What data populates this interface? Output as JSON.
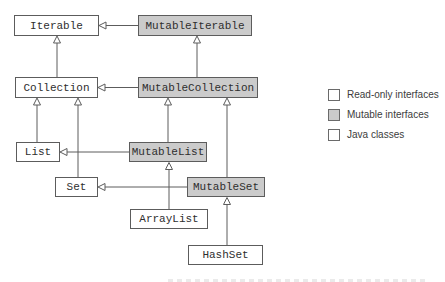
{
  "diagram": {
    "nodes": [
      {
        "label": "Iterable",
        "category": "read-only interface"
      },
      {
        "label": "MutableIterable",
        "category": "mutable interface"
      },
      {
        "label": "Collection",
        "category": "read-only interface"
      },
      {
        "label": "MutableCollection",
        "category": "mutable interface"
      },
      {
        "label": "List",
        "category": "read-only interface"
      },
      {
        "label": "MutableList",
        "category": "mutable interface"
      },
      {
        "label": "Set",
        "category": "read-only interface"
      },
      {
        "label": "MutableSet",
        "category": "mutable interface"
      },
      {
        "label": "ArrayList",
        "category": "java class"
      },
      {
        "label": "HashSet",
        "category": "java class"
      }
    ],
    "edges": [
      {
        "from": "Collection",
        "to": "Iterable",
        "relation": "extends"
      },
      {
        "from": "MutableIterable",
        "to": "Iterable",
        "relation": "extends"
      },
      {
        "from": "MutableCollection",
        "to": "MutableIterable",
        "relation": "extends"
      },
      {
        "from": "MutableCollection",
        "to": "Collection",
        "relation": "extends"
      },
      {
        "from": "List",
        "to": "Collection",
        "relation": "extends"
      },
      {
        "from": "Set",
        "to": "Collection",
        "relation": "extends"
      },
      {
        "from": "MutableList",
        "to": "MutableCollection",
        "relation": "extends"
      },
      {
        "from": "MutableList",
        "to": "List",
        "relation": "extends"
      },
      {
        "from": "MutableSet",
        "to": "MutableCollection",
        "relation": "extends"
      },
      {
        "from": "MutableSet",
        "to": "Set",
        "relation": "extends"
      },
      {
        "from": "ArrayList",
        "to": "MutableList",
        "relation": "implements"
      },
      {
        "from": "HashSet",
        "to": "MutableSet",
        "relation": "implements"
      }
    ]
  },
  "legend": {
    "items": [
      {
        "label": "Read-only interfaces",
        "swatch": "#ffffff"
      },
      {
        "label": "Mutable interfaces",
        "swatch": "#cbcbcb"
      },
      {
        "label": "Java classes",
        "swatch": "#ffffff"
      }
    ]
  },
  "colors": {
    "mutable_fill": "#cbcbcb",
    "box_border": "#5c5c5c",
    "connector": "#5c5c5c",
    "background": "#ffffff"
  }
}
